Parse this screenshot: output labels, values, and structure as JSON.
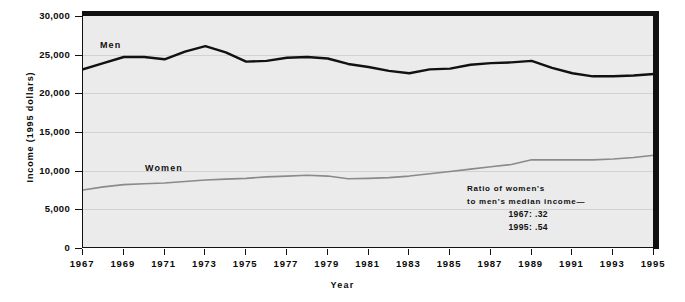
{
  "chart_data": {
    "type": "line",
    "title": "",
    "xlabel": "Year",
    "ylabel": "Income (1995 dollars)",
    "ylim": [
      0,
      30000
    ],
    "xlim": [
      1967,
      1995
    ],
    "grid": true,
    "legend": "inline-labels",
    "ytick_labels": [
      "30,000",
      "25,000",
      "20,000",
      "15,000",
      "10,000",
      "5,000",
      "0"
    ],
    "ytick_values": [
      30000,
      25000,
      20000,
      15000,
      10000,
      5000,
      0
    ],
    "xtick_labels": [
      "1967",
      "1969",
      "1971",
      "1973",
      "1975",
      "1977",
      "1979",
      "1981",
      "1983",
      "1985",
      "1987",
      "1989",
      "1991",
      "1993",
      "1995"
    ],
    "xtick_values": [
      1967,
      1969,
      1971,
      1973,
      1975,
      1977,
      1979,
      1981,
      1983,
      1985,
      1987,
      1989,
      1991,
      1993,
      1995
    ],
    "x": [
      1967,
      1968,
      1969,
      1970,
      1971,
      1972,
      1973,
      1974,
      1975,
      1976,
      1977,
      1978,
      1979,
      1980,
      1981,
      1982,
      1983,
      1984,
      1985,
      1986,
      1987,
      1988,
      1989,
      1990,
      1991,
      1992,
      1993,
      1994,
      1995
    ],
    "series": [
      {
        "name": "Men",
        "color": "#111111",
        "values": [
          23100,
          23900,
          24700,
          24700,
          24400,
          25400,
          26100,
          25300,
          24100,
          24200,
          24600,
          24700,
          24500,
          23800,
          23400,
          22900,
          22600,
          23100,
          23200,
          23700,
          23900,
          24000,
          24200,
          23300,
          22600,
          22200,
          22200,
          22300,
          22500
        ]
      },
      {
        "name": "Women",
        "color": "#8a8a8a",
        "values": [
          7500,
          7900,
          8200,
          8300,
          8400,
          8600,
          8800,
          8900,
          9000,
          9200,
          9300,
          9400,
          9300,
          8950,
          9000,
          9100,
          9300,
          9600,
          9900,
          10200,
          10500,
          10800,
          11400,
          11400,
          11400,
          11400,
          11500,
          11700,
          12000
        ]
      }
    ],
    "annotations": [
      {
        "id": "ratio-note",
        "lines": [
          "Ratio of women's",
          "to men's median income—"
        ],
        "values": [
          "1967: .32",
          "1995: .54"
        ]
      }
    ]
  }
}
